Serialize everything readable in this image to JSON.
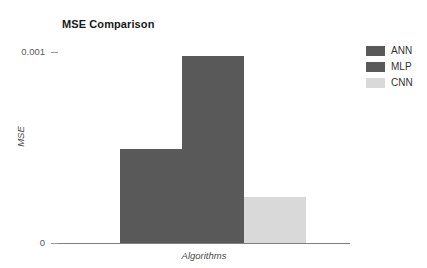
{
  "chart_data": {
    "type": "bar",
    "title": "MSE Comparison",
    "xlabel": "Algorithms",
    "ylabel": "MSE",
    "categories": [
      "ANN",
      "MLP",
      "CNN"
    ],
    "values": [
      0.00049,
      0.00098,
      0.00024
    ],
    "series": [
      {
        "name": "MSE",
        "values": [
          0.00049,
          0.00098,
          0.00024
        ]
      }
    ],
    "colors": [
      "#595959",
      "#595959",
      "#d9d9d9"
    ],
    "ylim": [
      0,
      0.001
    ],
    "ytick_labels": [
      "0.001",
      "0"
    ],
    "ytick_values": [
      0.001,
      0
    ],
    "grid": false,
    "legend_position": "right",
    "legend": [
      {
        "label": "ANN",
        "color": "#595959"
      },
      {
        "label": "MLP",
        "color": "#595959"
      },
      {
        "label": "CNN",
        "color": "#d9d9d9"
      }
    ]
  }
}
